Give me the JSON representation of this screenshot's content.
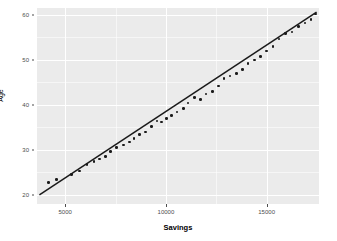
{
  "chart_data": {
    "type": "scatter",
    "title": "",
    "xlabel": "Savings",
    "ylabel": "Age",
    "xlim": [
      3600,
      17600
    ],
    "ylim": [
      18.0,
      61.5
    ],
    "grid": true,
    "legend": null,
    "xticks": [
      5000,
      10000,
      15000
    ],
    "xtick_labels": [
      "5000",
      "10000",
      "15000"
    ],
    "yticks": [
      20,
      30,
      40,
      50,
      60
    ],
    "ytick_labels": [
      "20",
      "30",
      "40",
      "50",
      "60"
    ],
    "x_minor_ticks": [
      7500,
      12500
    ],
    "y_minor_ticks": [
      25,
      35,
      45,
      55
    ],
    "panel_background": "#ebebeb",
    "grid_color": "#ffffff",
    "point_color": "#1a1a1a",
    "line_color": "#1a1a1a",
    "series": [
      {
        "name": "observations",
        "type": "scatter",
        "x": [
          4180,
          4560,
          5320,
          5720,
          6080,
          6420,
          6700,
          7000,
          7260,
          7560,
          7880,
          8180,
          8420,
          8700,
          9000,
          9280,
          9560,
          9780,
          10020,
          10280,
          10560,
          10860,
          11100,
          11420,
          11720,
          12000,
          12300,
          12600,
          12880,
          13180,
          13500,
          13800,
          14080,
          14400,
          14700,
          15000,
          15320,
          15620,
          15940,
          16260,
          16580,
          16900,
          17200,
          17440
        ],
        "y": [
          22.8,
          23.4,
          24.6,
          25.3,
          26.8,
          27.4,
          28.0,
          28.6,
          29.6,
          30.6,
          31.1,
          31.8,
          32.6,
          33.4,
          34.0,
          35.2,
          36.4,
          36.2,
          37.0,
          37.6,
          38.4,
          39.2,
          40.4,
          41.6,
          41.2,
          42.4,
          43.0,
          44.2,
          45.8,
          46.4,
          47.0,
          47.8,
          49.2,
          50.0,
          50.8,
          52.0,
          53.0,
          54.6,
          55.8,
          56.2,
          57.4,
          58.2,
          59.0,
          60.2
        ]
      },
      {
        "name": "fitted-regression-line",
        "type": "line",
        "x": [
          3720,
          17480
        ],
        "y": [
          20.0,
          60.6
        ]
      }
    ]
  },
  "axes": {
    "y_title": "Age",
    "x_title": "Savings"
  }
}
